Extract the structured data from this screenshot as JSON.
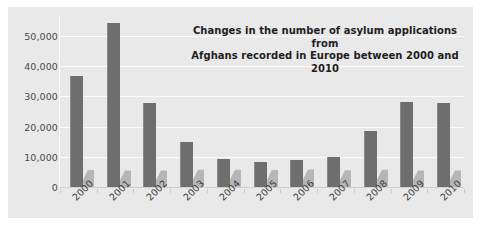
{
  "chart_data": {
    "type": "bar",
    "title": "Changes in the number of asylum applications from Afghans recorded in Europe between 2000 and 2010",
    "title_line1": "Changes in the number of asylum applications from",
    "title_line2": "Afghans recorded in Europe between 2000 and 2010",
    "xlabel": "",
    "ylabel": "",
    "categories": [
      "2000",
      "2001",
      "2002",
      "2003",
      "2004",
      "2005",
      "2006",
      "2007",
      "2008",
      "2009",
      "2010"
    ],
    "values": [
      36800,
      54500,
      28000,
      14800,
      9200,
      8300,
      8800,
      10000,
      18500,
      28300,
      28000
    ],
    "ylim": [
      0,
      57000
    ],
    "yticks": [
      0,
      10000,
      20000,
      30000,
      40000,
      50000
    ],
    "ytick_labels": [
      "0",
      "10,000",
      "20,000",
      "30,000",
      "40,000",
      "50,000"
    ],
    "grid": true,
    "legend": "none",
    "series": [
      {
        "name": "Asylum applications",
        "values": [
          36800,
          54500,
          28000,
          14800,
          9200,
          8300,
          8800,
          10000,
          18500,
          28300,
          28000
        ]
      }
    ]
  },
  "style": {
    "bar_color": "#6e6e6e",
    "shadow_color": "#b6b6b6",
    "plot_background": "#e9e9e9",
    "gridline_color": "#fbfbfb",
    "axis_text_color": "#4a4a4a",
    "title_color": "#1e1e1e",
    "page_background": "#ffffff"
  }
}
